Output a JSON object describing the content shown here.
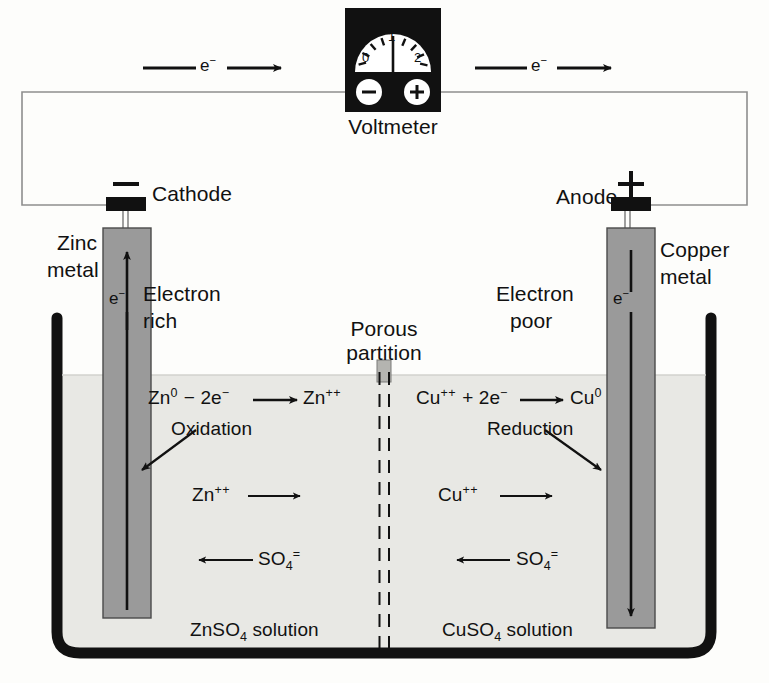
{
  "diagram": {
    "colors": {
      "ink": "#111111",
      "electrode_fill": "#9a9a9a",
      "solution_fill": "#e8e8e4",
      "beaker_stroke": "#111111",
      "background": "#fdfdfb",
      "meter_body": "#111111",
      "meter_face": "#ffffff"
    }
  },
  "meter": {
    "label": "Voltmeter",
    "ticks": [
      "0",
      "1",
      "2"
    ],
    "negative_terminal": "−",
    "positive_terminal": "+",
    "needle_value": "1"
  },
  "circuit": {
    "electron_flow_left": "e",
    "electron_flow_left_charge": "−",
    "electron_flow_right": "e",
    "electron_flow_right_charge": "−"
  },
  "left_cell": {
    "terminal_sign": "—",
    "electrode_label": "Cathode",
    "metal_label_line1": "Zinc",
    "metal_label_line2": "metal",
    "state_line1": "Electron",
    "state_line2": "rich",
    "electron_symbol": "e",
    "electron_charge": "−",
    "equation": {
      "species_in": "Zn",
      "species_in_charge": "0",
      "operator": "− 2e",
      "operator_charge": "−",
      "species_out": "Zn",
      "species_out_charge": "++"
    },
    "reaction_name": "Oxidation",
    "cation": "Zn",
    "cation_charge": "++",
    "anion": "SO",
    "anion_sub": "4",
    "anion_charge": "=",
    "solution": "ZnSO",
    "solution_sub": "4",
    "solution_suffix": " solution"
  },
  "right_cell": {
    "terminal_sign": "+",
    "electrode_label": "Anode",
    "metal_label_line1": "Copper",
    "metal_label_line2": "metal",
    "state_line1": "Electron",
    "state_line2": "poor",
    "electron_symbol": "e",
    "electron_charge": "−",
    "equation": {
      "species_in": "Cu",
      "species_in_charge": "++",
      "operator": "+ 2e",
      "operator_charge": "−",
      "species_out": "Cu",
      "species_out_charge": "0"
    },
    "reaction_name": "Reduction",
    "cation": "Cu",
    "cation_charge": "++",
    "anion": "SO",
    "anion_sub": "4",
    "anion_charge": "=",
    "solution": "CuSO",
    "solution_sub": "4",
    "solution_suffix": " solution"
  },
  "partition": {
    "line1": "Porous",
    "line2": "partition"
  }
}
